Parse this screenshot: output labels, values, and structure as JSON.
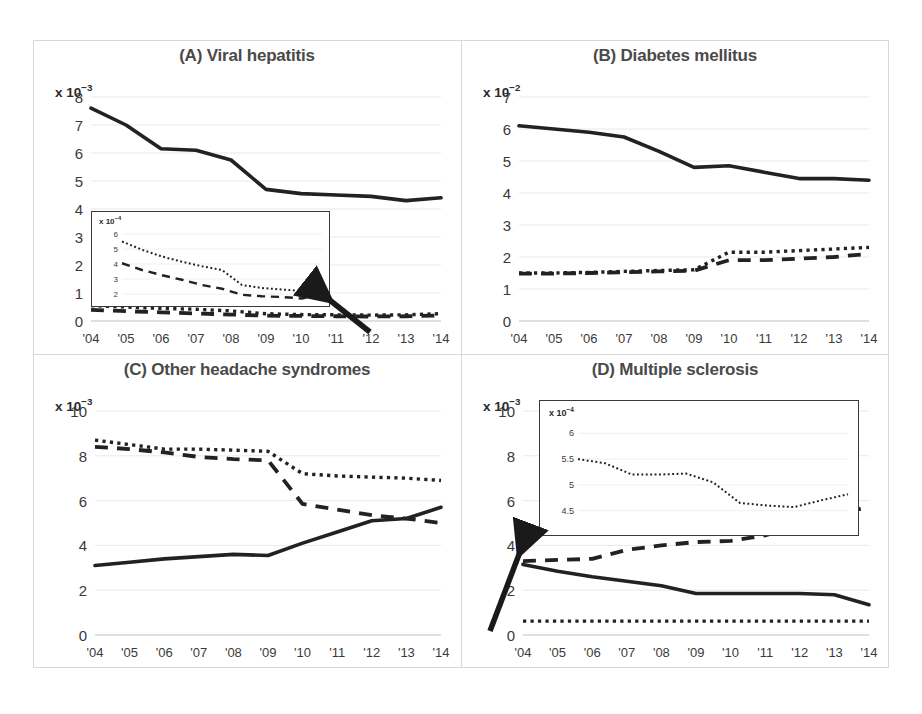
{
  "figure": {
    "background_color": "#ffffff",
    "line_color": "#222222",
    "title_color": "#4a4a4a",
    "grid_color": "#e9e9e9",
    "frame_color": "#d8d8d8"
  },
  "panels": [
    {
      "id": "A",
      "title": "(A) Viral hepatitis",
      "y_exponent_label": "x 10",
      "y_exponent_sup": "−3",
      "y_ticks": [
        "0",
        "1",
        "2",
        "3",
        "4",
        "5",
        "6",
        "7",
        "8"
      ],
      "x_ticks": [
        "'04",
        "'05",
        "'06",
        "'07",
        "'08",
        "'09",
        "'10",
        "'11",
        "'12",
        "'13",
        "'14"
      ],
      "has_inset": true,
      "has_arrow": true,
      "arrow_direction": "up-left",
      "inset": {
        "y_exponent_label": "x 10",
        "y_exponent_sup": "−4",
        "y_ticks": [
          "2",
          "3",
          "4",
          "5",
          "6"
        ]
      }
    },
    {
      "id": "B",
      "title": "(B) Diabetes mellitus",
      "y_exponent_label": "x 10",
      "y_exponent_sup": "−2",
      "y_ticks": [
        "0",
        "1",
        "2",
        "3",
        "4",
        "5",
        "6",
        "7"
      ],
      "x_ticks": [
        "'04",
        "'05",
        "'06",
        "'07",
        "'08",
        "'09",
        "'10",
        "'11",
        "'12",
        "'13",
        "'14"
      ],
      "has_inset": false,
      "has_arrow": false
    },
    {
      "id": "C",
      "title": "(C) Other headache syndromes",
      "y_exponent_label": "x 10",
      "y_exponent_sup": "−3",
      "y_ticks": [
        "0",
        "2",
        "4",
        "6",
        "8",
        "10"
      ],
      "x_ticks": [
        "'04",
        "'05",
        "'06",
        "'07",
        "'08",
        "'09",
        "'10",
        "'11",
        "'12",
        "'13",
        "'14"
      ],
      "has_inset": false,
      "has_arrow": false
    },
    {
      "id": "D",
      "title": "(D) Multiple sclerosis",
      "y_exponent_label": "x 10",
      "y_exponent_sup": "−3",
      "y_ticks": [
        "0",
        "2",
        "4",
        "6",
        "8",
        "10"
      ],
      "x_ticks": [
        "'04",
        "'05",
        "'06",
        "'07",
        "'08",
        "'09",
        "'10",
        "'11",
        "'12",
        "'13",
        "'14"
      ],
      "has_inset": true,
      "has_arrow": true,
      "arrow_direction": "up-right",
      "inset": {
        "y_exponent_label": "x 10",
        "y_exponent_sup": "−4",
        "y_ticks": [
          "4.5",
          "5",
          "5.5",
          "6"
        ]
      }
    }
  ],
  "chart_data": [
    {
      "type": "line",
      "panel": "A",
      "title": "(A) Viral hepatitis",
      "xlabel": "",
      "ylabel": "x 10−3",
      "x": [
        "'04",
        "'05",
        "'06",
        "'07",
        "'08",
        "'09",
        "'10",
        "'11",
        "'12",
        "'13",
        "'14"
      ],
      "ylim": [
        0,
        8
      ],
      "yticks": [
        0,
        1,
        2,
        3,
        4,
        5,
        6,
        7,
        8
      ],
      "grid": true,
      "legend": "none",
      "series": [
        {
          "name": "solid",
          "style": "solid",
          "values": [
            7.6,
            7.0,
            6.15,
            6.1,
            5.75,
            4.7,
            4.55,
            4.5,
            4.45,
            4.3,
            4.4
          ]
        },
        {
          "name": "dotted",
          "style": "dotted",
          "values": [
            0.55,
            0.5,
            0.45,
            0.42,
            0.36,
            0.26,
            0.23,
            0.22,
            0.21,
            0.22,
            0.26
          ]
        },
        {
          "name": "dashed",
          "style": "dashed",
          "values": [
            0.4,
            0.35,
            0.31,
            0.27,
            0.23,
            0.19,
            0.18,
            0.17,
            0.16,
            0.17,
            0.2
          ]
        }
      ],
      "inset": {
        "type": "line",
        "ylim": [
          1.6,
          6.4
        ],
        "yticks": [
          2,
          3,
          4,
          5,
          6
        ],
        "ylabel": "x 10−4",
        "x": [
          "'04",
          "'05",
          "'06",
          "'07",
          "'08",
          "'09",
          "'10",
          "'11",
          "'12",
          "'13",
          "'14"
        ],
        "series": [
          {
            "name": "dotted",
            "style": "dotted",
            "values": [
              5.5,
              4.95,
              4.5,
              4.15,
              3.85,
              3.6,
              2.6,
              2.4,
              2.3,
              2.2,
              2.7
            ]
          },
          {
            "name": "dashed",
            "style": "dashed",
            "values": [
              4.05,
              3.6,
              3.25,
              2.95,
              2.6,
              2.35,
              1.95,
              1.85,
              1.8,
              1.7,
              2.0
            ]
          }
        ]
      },
      "annotation": {
        "type": "arrow",
        "points_to": "inset"
      }
    },
    {
      "type": "line",
      "panel": "B",
      "title": "(B) Diabetes mellitus",
      "xlabel": "",
      "ylabel": "x 10−2",
      "x": [
        "'04",
        "'05",
        "'06",
        "'07",
        "'08",
        "'09",
        "'10",
        "'11",
        "'12",
        "'13",
        "'14"
      ],
      "ylim": [
        0,
        7
      ],
      "yticks": [
        0,
        1,
        2,
        3,
        4,
        5,
        6,
        7
      ],
      "grid": true,
      "legend": "none",
      "series": [
        {
          "name": "solid",
          "style": "solid",
          "values": [
            6.1,
            6.0,
            5.9,
            5.75,
            5.3,
            4.8,
            4.85,
            4.65,
            4.45,
            4.45,
            4.4
          ]
        },
        {
          "name": "dotted",
          "style": "dotted",
          "values": [
            1.5,
            1.5,
            1.52,
            1.55,
            1.58,
            1.6,
            2.15,
            2.15,
            2.2,
            2.25,
            2.3
          ]
        },
        {
          "name": "dashed",
          "style": "dashed",
          "values": [
            1.48,
            1.48,
            1.5,
            1.52,
            1.55,
            1.57,
            1.9,
            1.9,
            1.95,
            2.0,
            2.1
          ]
        }
      ]
    },
    {
      "type": "line",
      "panel": "C",
      "title": "(C) Other headache syndromes",
      "xlabel": "",
      "ylabel": "x 10−3",
      "x": [
        "'04",
        "'05",
        "'06",
        "'07",
        "'08",
        "'09",
        "'10",
        "'11",
        "'12",
        "'13",
        "'14"
      ],
      "ylim": [
        0,
        10
      ],
      "yticks": [
        0,
        2,
        4,
        6,
        8,
        10
      ],
      "grid": true,
      "legend": "none",
      "series": [
        {
          "name": "solid",
          "style": "solid",
          "values": [
            3.1,
            3.25,
            3.4,
            3.5,
            3.6,
            3.55,
            4.1,
            4.6,
            5.1,
            5.2,
            5.7
          ]
        },
        {
          "name": "dotted",
          "style": "dotted",
          "values": [
            8.7,
            8.5,
            8.3,
            8.3,
            8.25,
            8.2,
            7.2,
            7.1,
            7.05,
            7.0,
            6.9
          ]
        },
        {
          "name": "dashed",
          "style": "dashed",
          "values": [
            8.4,
            8.3,
            8.15,
            7.95,
            7.85,
            7.8,
            5.85,
            5.6,
            5.35,
            5.2,
            5.0
          ]
        }
      ]
    },
    {
      "type": "line",
      "panel": "D",
      "title": "(D) Multiple sclerosis",
      "xlabel": "",
      "ylabel": "x 10−3",
      "x": [
        "'04",
        "'05",
        "'06",
        "'07",
        "'08",
        "'09",
        "'10",
        "'11",
        "'12",
        "'13",
        "'14"
      ],
      "ylim": [
        0,
        10
      ],
      "yticks": [
        0,
        2,
        4,
        6,
        8,
        10
      ],
      "grid": true,
      "legend": "none",
      "series": [
        {
          "name": "solid",
          "style": "solid",
          "values": [
            3.15,
            2.85,
            2.6,
            2.4,
            2.2,
            1.85,
            1.85,
            1.85,
            1.85,
            1.8,
            1.35
          ]
        },
        {
          "name": "dashed",
          "style": "dashed",
          "values": [
            3.3,
            3.35,
            3.4,
            3.8,
            4.0,
            4.15,
            4.2,
            4.45,
            4.9,
            5.3,
            5.75
          ]
        },
        {
          "name": "dotted",
          "style": "dotted",
          "values": [
            0.62,
            0.62,
            0.62,
            0.62,
            0.62,
            0.62,
            0.62,
            0.62,
            0.62,
            0.62,
            0.62
          ]
        }
      ],
      "inset": {
        "type": "line",
        "ylim": [
          4.3,
          6.2
        ],
        "yticks": [
          4.5,
          5,
          5.5,
          6
        ],
        "ylabel": "x 10−4",
        "x": [
          "'04",
          "'05",
          "'06",
          "'07",
          "'08",
          "'09",
          "'10",
          "'11",
          "'12",
          "'13",
          "'14"
        ],
        "series": [
          {
            "name": "dotted",
            "style": "dotted",
            "values": [
              5.5,
              5.42,
              5.2,
              5.2,
              5.22,
              5.05,
              4.65,
              4.6,
              4.57,
              4.7,
              4.82
            ]
          }
        ]
      },
      "annotation": {
        "type": "arrow",
        "points_to": "inset"
      }
    }
  ]
}
